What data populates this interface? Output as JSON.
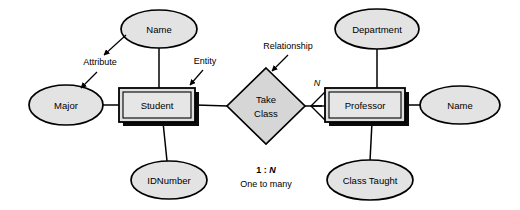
{
  "diagram": {
    "type": "entity-relationship-diagram",
    "background_color": "#ffffff",
    "shape_fill_color": "#e0e0e0",
    "stroke_color": "#000000",
    "entities": [
      {
        "id": "student",
        "label": "Student",
        "shape": "double-rectangle",
        "x": 157,
        "y": 105,
        "width": 76,
        "height": 34
      },
      {
        "id": "professor",
        "label": "Professor",
        "shape": "double-rectangle",
        "x": 365,
        "y": 105,
        "width": 80,
        "height": 34
      }
    ],
    "attributes": [
      {
        "id": "student-name",
        "label": "Name",
        "shape": "ellipse",
        "x": 159,
        "y": 29,
        "rx": 38,
        "ry": 19,
        "owner": "student"
      },
      {
        "id": "student-major",
        "label": "Major",
        "shape": "ellipse",
        "x": 66,
        "y": 105,
        "rx": 37,
        "ry": 20,
        "owner": "student"
      },
      {
        "id": "student-idnumber",
        "label": "IDNumber",
        "shape": "ellipse",
        "x": 169,
        "y": 180,
        "rx": 38,
        "ry": 19,
        "owner": "student"
      },
      {
        "id": "professor-department",
        "label": "Department",
        "shape": "ellipse",
        "x": 377,
        "y": 29,
        "rx": 42,
        "ry": 20,
        "owner": "professor"
      },
      {
        "id": "professor-name",
        "label": "Name",
        "shape": "ellipse",
        "x": 460,
        "y": 105,
        "rx": 40,
        "ry": 19,
        "owner": "professor"
      },
      {
        "id": "professor-class-taught",
        "label": "Class Taught",
        "shape": "ellipse",
        "x": 370,
        "y": 180,
        "rx": 43,
        "ry": 20,
        "owner": "professor"
      }
    ],
    "relationships": [
      {
        "id": "take-class",
        "label_line1": "Take",
        "label_line2": "Class",
        "shape": "diamond",
        "x": 266,
        "y": 106,
        "half_width": 39,
        "half_height": 38,
        "from": "student",
        "to": "professor",
        "cardinality_marker": "N",
        "marker_style": "crows-foot"
      }
    ],
    "annotations": [
      {
        "id": "attribute-annotation",
        "label": "Attribute",
        "x": 100,
        "y": 62,
        "arrow_style": "double-headed"
      },
      {
        "id": "entity-annotation",
        "label": "Entity",
        "x": 205,
        "y": 61,
        "arrow_style": "single-headed"
      },
      {
        "id": "relationship-annotation",
        "label": "Relationship",
        "x": 288,
        "y": 46,
        "arrow_style": "single-headed"
      }
    ],
    "legend": {
      "ratio_prefix": "1 : ",
      "ratio_variable": "N",
      "description": "One to many",
      "x": 266,
      "y_ratio": 171,
      "y_description": 185
    }
  }
}
